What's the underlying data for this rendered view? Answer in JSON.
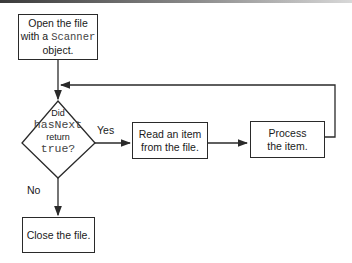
{
  "diagram": {
    "nodes": {
      "open": {
        "line1": "Open the file",
        "line2_prefix": "with a ",
        "line2_code": "Scanner",
        "line3": "object."
      },
      "decision": {
        "line1": "Did",
        "line2_code": "hasNext",
        "line3": "return",
        "line4_code": "true?"
      },
      "read": {
        "line1": "Read an item",
        "line2": "from the file."
      },
      "process": {
        "line1": "Process",
        "line2": "the item."
      },
      "close": {
        "line1": "Close the file."
      }
    },
    "edges": {
      "yes_label": "Yes",
      "no_label": "No"
    },
    "colors": {
      "stroke": "#2a2a2a",
      "background": "#ffffff"
    }
  }
}
